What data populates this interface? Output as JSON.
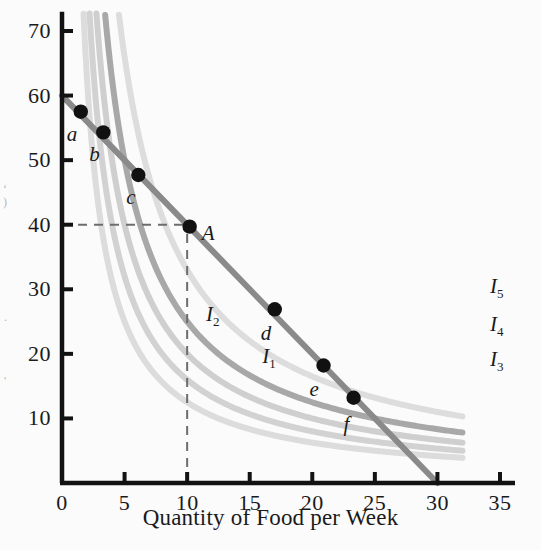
{
  "figure": {
    "background_color": "#fbfbfb",
    "axis_color": "#121212"
  },
  "chart_data": {
    "type": "line",
    "title": "",
    "xlabel": "Quantity of Food per Week",
    "ylabel": "",
    "xlim": [
      0,
      36.2
    ],
    "ylim": [
      0,
      73
    ],
    "grid": false,
    "legend_position": "inline-right",
    "x_ticks": [
      0,
      5,
      10,
      15,
      20,
      25,
      30,
      35
    ],
    "y_ticks": [
      10,
      20,
      30,
      40,
      50,
      60,
      70
    ],
    "x_tick_labels": [
      "0",
      "5",
      "10",
      "15",
      "20",
      "25",
      "30",
      "35"
    ],
    "y_tick_labels": [
      "10",
      "20",
      "30",
      "40",
      "50",
      "60",
      "70"
    ],
    "budget_line": {
      "name": "Budget line",
      "color": "#8a8a8a",
      "width": 6,
      "x": [
        0,
        30
      ],
      "y": [
        60,
        0
      ]
    },
    "series": [
      {
        "name": "I1",
        "label": "I",
        "subscript": "1",
        "color": "#dcdcdc",
        "width": 6,
        "k": 125,
        "x_start": 1.72,
        "x_end": 32.0,
        "label_x": 16.0,
        "label_y": 19.5
      },
      {
        "name": "I2",
        "label": "I",
        "subscript": "2",
        "color": "#d2d2d2",
        "width": 6,
        "k": 160,
        "x_start": 2.2,
        "x_end": 32.0,
        "label_x": 11.5,
        "label_y": 26.0
      },
      {
        "name": "I3",
        "label": "I",
        "subscript": "3",
        "color": "#cfcfcf",
        "width": 6,
        "k": 200,
        "x_start": 2.75,
        "x_end": 32.0,
        "label_x": 34.2,
        "label_y": 19.0
      },
      {
        "name": "I4",
        "label": "I",
        "subscript": "4",
        "color": "#a8a8a8",
        "width": 6,
        "k": 250,
        "x_start": 3.45,
        "x_end": 32.0,
        "label_x": 34.2,
        "label_y": 24.5
      },
      {
        "name": "I5",
        "label": "I",
        "subscript": "5",
        "color": "#dddddd",
        "width": 6,
        "k": 330,
        "x_start": 4.55,
        "x_end": 32.0,
        "label_x": 34.2,
        "label_y": 30.3
      }
    ],
    "points": [
      {
        "label": "a",
        "x": 1.5,
        "y": 57.5,
        "label_dx": -14,
        "label_dy": 12
      },
      {
        "label": "b",
        "x": 3.3,
        "y": 54.3,
        "label_dx": -14,
        "label_dy": 12
      },
      {
        "label": "c",
        "x": 6.1,
        "y": 47.7,
        "label_dx": -12,
        "label_dy": 12
      },
      {
        "label": "A",
        "x": 10.2,
        "y": 39.7,
        "label_dx": 12,
        "label_dy": -4,
        "italic_cap": true
      },
      {
        "label": "d",
        "x": 17.0,
        "y": 26.9,
        "label_dx": -14,
        "label_dy": 14
      },
      {
        "label": "e",
        "x": 20.9,
        "y": 18.2,
        "label_dx": -14,
        "label_dy": 14
      },
      {
        "label": "f",
        "x": 23.3,
        "y": 13.2,
        "label_dx": -10,
        "label_dy": 16
      }
    ],
    "guide_lines": [
      {
        "name": "horizontal-guide-to-A",
        "x": [
          0,
          10.2
        ],
        "y": [
          40,
          40
        ],
        "style": "dashed"
      },
      {
        "name": "vertical-guide-to-A",
        "x": [
          10,
          10
        ],
        "y": [
          0,
          40
        ],
        "style": "dashed"
      }
    ],
    "annotations": [
      {
        "text": "A",
        "x": 10.2,
        "y": 39.7,
        "role": "optimal-consumption-point"
      }
    ]
  }
}
